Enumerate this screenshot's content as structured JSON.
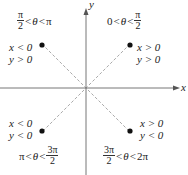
{
  "axes": {
    "x_label": "x",
    "y_label": "y",
    "origin": [
      86,
      88
    ]
  },
  "quadrants": [
    {
      "id": "Q1",
      "angle_lower": "0",
      "angle_var": "θ",
      "angle_upper_num": "π",
      "angle_upper_den": "2",
      "x_cond": "x > 0",
      "y_cond": "y > 0"
    },
    {
      "id": "Q2",
      "angle_lower_num": "π",
      "angle_lower_den": "2",
      "angle_var": "θ",
      "angle_upper": "π",
      "x_cond": "x < 0",
      "y_cond": "y > 0"
    },
    {
      "id": "Q3",
      "angle_lower": "π",
      "angle_var": "θ",
      "angle_upper_num": "3π",
      "angle_upper_den": "2",
      "x_cond": "x < 0",
      "y_cond": "y < 0"
    },
    {
      "id": "Q4",
      "angle_lower_num": "3π",
      "angle_lower_den": "2",
      "angle_var": "θ",
      "angle_upper": "2π",
      "x_cond": "x > 0",
      "y_cond": "y < 0"
    }
  ],
  "symbols": {
    "lt": "<"
  },
  "colors": {
    "axis": "#777777",
    "dashed": "#aaaaaa",
    "point": "#111111"
  }
}
